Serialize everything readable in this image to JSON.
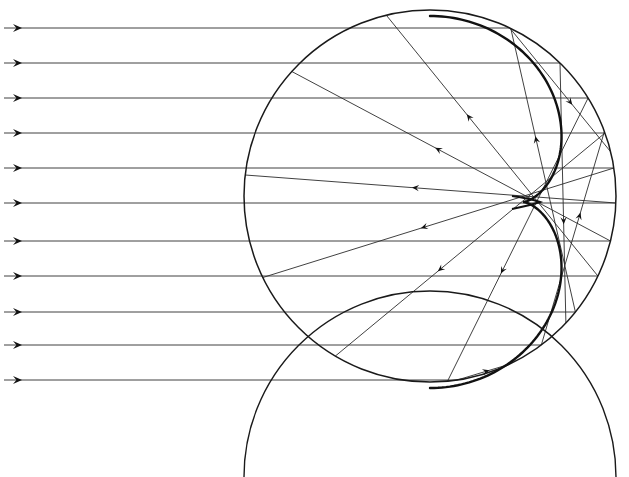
{
  "figure": {
    "width": 629,
    "height": 477,
    "background_color": "#ffffff",
    "ink_color": "#1a1a1a",
    "ray_color": "#2b2b2b",
    "caustic_color": "#111111"
  },
  "sphere": {
    "name": "spherical-mirror",
    "center_x": 430,
    "center_y": 196,
    "radius": 186,
    "stroke_width": 1.6,
    "color": "#1a1a1a"
  },
  "lower_sphere": {
    "name": "lower-sphere-arc",
    "center_x": 430,
    "center_y": 640,
    "radius": 186,
    "stroke_width": 1.4,
    "color": "#1a1a1a",
    "visible_from_y": 440
  },
  "caustic": {
    "name": "caustic-envelope",
    "cusp_x": 538,
    "cusp_y": 202,
    "stroke_width": 2.4,
    "color": "#111111",
    "description": "Nephroid caustic envelope of reflected rays, cusp on axis at half radius"
  },
  "axis": {
    "optical_axis_y": 202,
    "label": "optical axis"
  },
  "incoming_rays": {
    "name": "incoming-parallel-rays",
    "count": 11,
    "direction": "left-to-right",
    "start_x": 4,
    "stroke_width": 0.9,
    "color": "#2b2b2b",
    "arrow_x": 18,
    "y_values": [
      28,
      63,
      98,
      133,
      168,
      203,
      241,
      276,
      312,
      345,
      380
    ]
  },
  "reflected_rays": {
    "name": "reflected-rays",
    "count": 18,
    "stroke_width": 0.9,
    "color": "#2b2b2b",
    "note": "Each incoming ray reflects off the sphere's far interior wall; reflected segments cross near the cusp and form the caustic envelope"
  },
  "arrowheads": {
    "name": "ray-arrowheads",
    "size": 7,
    "color": "#111111",
    "incoming_count": 11,
    "reflected_count": 14
  },
  "legend": {
    "visible": false,
    "entries": []
  },
  "chart_data": {
    "type": "line",
    "xlabel": "",
    "ylabel": "",
    "xlim": [
      0,
      629
    ],
    "ylim": [
      477,
      0
    ],
    "grid": false,
    "legend_position": "none",
    "annotations": [],
    "series": [
      {
        "name": "incoming-parallel-rays",
        "type": "horizontal-rays",
        "y": [
          28,
          63,
          98,
          133,
          168,
          203,
          241,
          276,
          312,
          345,
          380
        ],
        "x_start": 4,
        "x_end_note": "terminates on sphere interior right wall"
      },
      {
        "name": "sphere-outline",
        "type": "circle",
        "cx": 430,
        "cy": 196,
        "r": 186
      },
      {
        "name": "caustic-nephroid",
        "type": "envelope",
        "cusp": [
          538,
          202
        ],
        "parent_circle": [
          430,
          196,
          186
        ]
      },
      {
        "name": "lower-sphere-arc",
        "type": "circle-arc",
        "cx": 430,
        "cy": 640,
        "r": 186
      }
    ]
  }
}
